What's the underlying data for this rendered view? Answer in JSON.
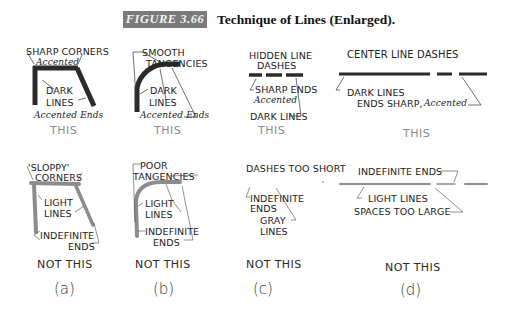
{
  "figure": {
    "label": "FIGURE 3.66",
    "title": "Technique of Lines (Enlarged).",
    "label_bg_color": "#7a7a7a"
  },
  "panels": [
    {
      "id": "a",
      "letter": "(a)",
      "good": {
        "callouts": [
          "SHARP CORNERS",
          "Accented",
          "DARK",
          "LINES",
          "Accented Ends"
        ],
        "verdict": "THIS"
      },
      "bad": {
        "callouts": [
          "'SLOPPY'",
          "CORNERS",
          "LIGHT",
          "LINES",
          "INDEFINITE",
          "ENDS"
        ],
        "verdict": "NOT THIS"
      }
    },
    {
      "id": "b",
      "letter": "(b)",
      "good": {
        "callouts": [
          "SMOOTH",
          "TANGENCIES",
          "DARK",
          "LINES",
          "Accented Ends"
        ],
        "verdict": "THIS"
      },
      "bad": {
        "callouts": [
          "POOR",
          "TANGENCIES",
          "LIGHT",
          "LINES",
          "INDEFINITE",
          "ENDS"
        ],
        "verdict": "NOT THIS"
      }
    },
    {
      "id": "c",
      "letter": "(c)",
      "good": {
        "heading": [
          "HIDDEN LINE",
          "DASHES"
        ],
        "callouts": [
          "SHARP ENDS",
          "Accented",
          "DARK LINES"
        ],
        "verdict": "THIS"
      },
      "bad": {
        "heading": [
          "DASHES TOO SHORT"
        ],
        "callouts": [
          "INDEFINITE",
          "ENDS",
          "GRAY",
          "LINES"
        ],
        "verdict": "NOT THIS"
      }
    },
    {
      "id": "d",
      "letter": "(d)",
      "good": {
        "heading": [
          "CENTER LINE DASHES"
        ],
        "callouts": [
          "DARK LINES",
          "ENDS SHARP,",
          "Accented"
        ],
        "verdict": "THIS"
      },
      "bad": {
        "callouts": [
          "INDEFINITE ENDS",
          "LIGHT LINES",
          "SPACES TOO LARGE"
        ],
        "verdict": "NOT THIS"
      }
    }
  ],
  "colors": {
    "dark_line": "#2b2b2b",
    "light_line": "#8c8c8c",
    "this_text": "#8a8a8a"
  }
}
